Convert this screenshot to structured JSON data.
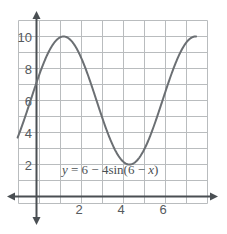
{
  "chart_data": {
    "type": "line",
    "title": "",
    "subtitle": "",
    "xlabel": "",
    "ylabel": "",
    "equation": "y = 6 − 4sin(6 − x)",
    "equation_parts": {
      "y": "y",
      "equals": " = 6 − 4sin(6 − ",
      "x": "x",
      "close": ")"
    },
    "function": "y = 6 - 4*sin(6 - x)",
    "amplitude": 4,
    "midline": 6,
    "period": 6.2832,
    "xlim": [
      -0.9,
      7.6
    ],
    "ylim": [
      -0.85,
      11.0
    ],
    "x_ticks": [
      2,
      4,
      6
    ],
    "x_tick_labels": [
      "2",
      "4",
      "6"
    ],
    "y_ticks": [
      2,
      4,
      6,
      8,
      10
    ],
    "y_tick_labels": [
      "2",
      "4",
      "6",
      "8",
      "10"
    ],
    "grid": true,
    "grid_spacing_x": 1,
    "grid_spacing_y": 1,
    "legend": "none",
    "axis_arrows": [
      "left",
      "right",
      "up",
      "down"
    ],
    "key_points": [
      {
        "x": -0.9,
        "y": 4.55,
        "note": "left edge of curve"
      },
      {
        "x": 0.0,
        "y": 7.12,
        "note": "y-intercept"
      },
      {
        "x": 1.29,
        "y": 10.0,
        "note": "maximum"
      },
      {
        "x": 2.86,
        "y": 6.0,
        "note": "midline crossing descending"
      },
      {
        "x": 4.43,
        "y": 2.0,
        "note": "minimum"
      },
      {
        "x": 6.0,
        "y": 6.0,
        "note": "midline crossing ascending"
      },
      {
        "x": 7.55,
        "y": 9.95,
        "note": "right edge of curve"
      }
    ],
    "series": [
      {
        "name": "y = 6 - 4sin(6 - x)",
        "color": "#6b6f73",
        "x": [
          -0.9,
          -0.6,
          -0.3,
          0.0,
          0.3,
          0.6,
          0.9,
          1.2,
          1.5,
          1.8,
          2.1,
          2.4,
          2.7,
          3.0,
          3.3,
          3.6,
          3.9,
          4.2,
          4.5,
          4.8,
          5.1,
          5.4,
          5.7,
          6.0,
          6.3,
          6.6,
          6.9,
          7.2,
          7.5
        ],
        "values": [
          4.55,
          5.39,
          6.27,
          7.12,
          7.9,
          8.6,
          9.2,
          9.65,
          9.92,
          10.0,
          9.87,
          9.54,
          9.03,
          8.37,
          7.58,
          6.71,
          5.81,
          4.93,
          4.1,
          3.38,
          2.79,
          2.36,
          2.1,
          2.01,
          2.1,
          2.36,
          2.79,
          3.38,
          4.1
        ]
      }
    ],
    "colors": {
      "curve": "#6b6f73",
      "grid": "#b9bcbe",
      "axis": "#4a4f53",
      "tick_text": "#555a5e",
      "equation_text": "#4a4f53",
      "background": "#ffffff"
    }
  }
}
